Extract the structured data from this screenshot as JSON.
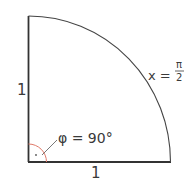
{
  "diagram": {
    "type": "quarter-circle-sector",
    "labels": {
      "radius_vertical": "1",
      "radius_horizontal": "1",
      "arc_label_prefix": "x =",
      "arc_numerator": "π",
      "arc_denominator": "2",
      "angle_label": "φ = 90°"
    },
    "colors": {
      "stroke": "#333333",
      "angle_marker": "#e07a6a",
      "text": "#3a3a3a"
    }
  }
}
